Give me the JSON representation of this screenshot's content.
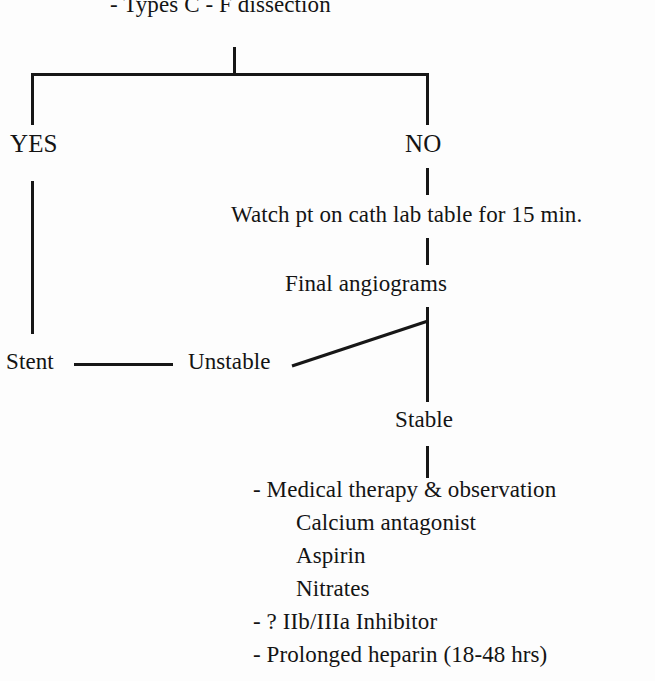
{
  "diagram": {
    "type": "clinical-decision-flowchart",
    "line_color": "#171717",
    "text_color": "#141414",
    "background": "#fdfdfd",
    "top_criterion": "- Types C - F dissection",
    "branches": {
      "yes_label": "YES",
      "no_label": "NO"
    },
    "yes_path": {
      "outcome": "Stent"
    },
    "no_path": {
      "step_1": "Watch pt on cath lab table for 15 min.",
      "step_2": "Final angiograms",
      "outcome_unstable": "Unstable",
      "outcome_stable": "Stable"
    },
    "therapy": {
      "items": [
        "- Medical therapy & observation",
        "Calcium antagonist",
        "Aspirin",
        "Nitrates",
        "- ? IIb/IIIa Inhibitor",
        "- Prolonged heparin (18-48 hrs)"
      ]
    }
  }
}
